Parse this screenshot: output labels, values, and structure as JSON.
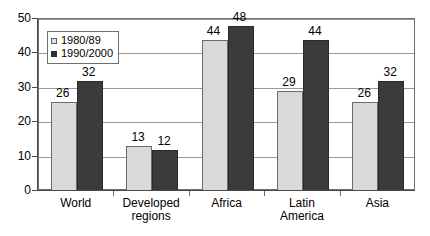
{
  "chart_data": {
    "type": "bar",
    "title": "",
    "xlabel": "",
    "ylabel": "",
    "ylim": [
      0,
      50
    ],
    "yticks": [
      0,
      10,
      20,
      30,
      40,
      50
    ],
    "grid": true,
    "legend_position": "top-left inside plot area",
    "categories": [
      "World",
      "Developed regions",
      "Africa",
      "Latin America",
      "Asia"
    ],
    "category_lines": [
      [
        "World"
      ],
      [
        "Developed",
        "regions"
      ],
      [
        "Africa"
      ],
      [
        "Latin",
        "America"
      ],
      [
        "Asia"
      ]
    ],
    "series": [
      {
        "name": "1980/89",
        "values": [
          26,
          13,
          44,
          29,
          26
        ],
        "color": "#d9d9d9"
      },
      {
        "name": "1990/2000",
        "values": [
          32,
          12,
          48,
          44,
          32
        ],
        "color": "#3b3b3b"
      }
    ],
    "data_labels": [
      {
        "category": "World",
        "series": "1980/89",
        "value": "26"
      },
      {
        "category": "World",
        "series": "1990/2000",
        "value": "32"
      },
      {
        "category": "Developed regions",
        "series": "1980/89",
        "value": "13"
      },
      {
        "category": "Developed regions",
        "series": "1990/2000",
        "value": "12"
      },
      {
        "category": "Africa",
        "series": "1980/89",
        "value": "44"
      },
      {
        "category": "Africa",
        "series": "1990/2000",
        "value": "48"
      },
      {
        "category": "Latin America",
        "series": "1980/89",
        "value": "29"
      },
      {
        "category": "Latin America",
        "series": "1990/2000",
        "value": "44"
      },
      {
        "category": "Asia",
        "series": "1980/89",
        "value": "26"
      },
      {
        "category": "Asia",
        "series": "1990/2000",
        "value": "32"
      }
    ]
  },
  "legend": {
    "entries": [
      {
        "label": "1980/89",
        "marker": "light-square-marker"
      },
      {
        "label": "1990/2000",
        "marker": "dark-square-marker"
      }
    ]
  },
  "axes": {
    "y_tick_labels": [
      "50",
      "40",
      "30",
      "20",
      "10",
      "0"
    ],
    "x_tick_labels": [
      "World",
      "Developed regions",
      "Africa",
      "Latin America",
      "Asia"
    ]
  },
  "title_sliver": {
    "text": "· · · · · · · · · · · ·"
  }
}
